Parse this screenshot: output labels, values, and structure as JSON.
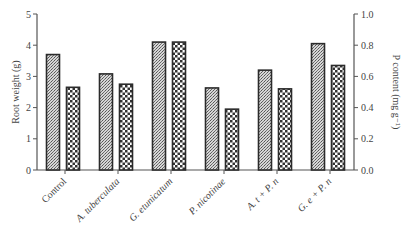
{
  "chart_data": {
    "type": "bar",
    "title": "",
    "xlabel": "",
    "ylabel": "Root weight (g)",
    "y2label": "P content (mg g⁻¹)",
    "ylim": [
      0,
      5
    ],
    "y2lim": [
      0,
      1.0
    ],
    "yticks": [
      "0",
      "1",
      "2",
      "3",
      "4",
      "5"
    ],
    "y2ticks": [
      "0.0",
      "0.2",
      "0.4",
      "0.6",
      "0.8",
      "1.0"
    ],
    "grid": false,
    "legend": null,
    "categories": [
      "Control",
      "A. tuberculata",
      "G. etunicatum",
      "P. nicotinae",
      "A. t + P. n",
      "G. e + P. n"
    ],
    "category_italic": [
      false,
      true,
      true,
      true,
      true,
      true
    ],
    "series": [
      {
        "name": "Root weight",
        "axis": "left",
        "pattern": "stipple",
        "values": [
          3.7,
          3.08,
          4.1,
          2.63,
          3.2,
          4.05
        ]
      },
      {
        "name": "P content",
        "axis": "right",
        "pattern": "checker",
        "values": [
          0.53,
          0.55,
          0.82,
          0.39,
          0.52,
          0.67
        ]
      }
    ]
  },
  "colors": {
    "bar_outline": "#2b2b2b",
    "axis": "#555555",
    "stipple_dark": "#555555",
    "stipple_light": "#d8d8d8",
    "checker_dark": "#2e2e2e",
    "checker_light": "#ffffff"
  }
}
